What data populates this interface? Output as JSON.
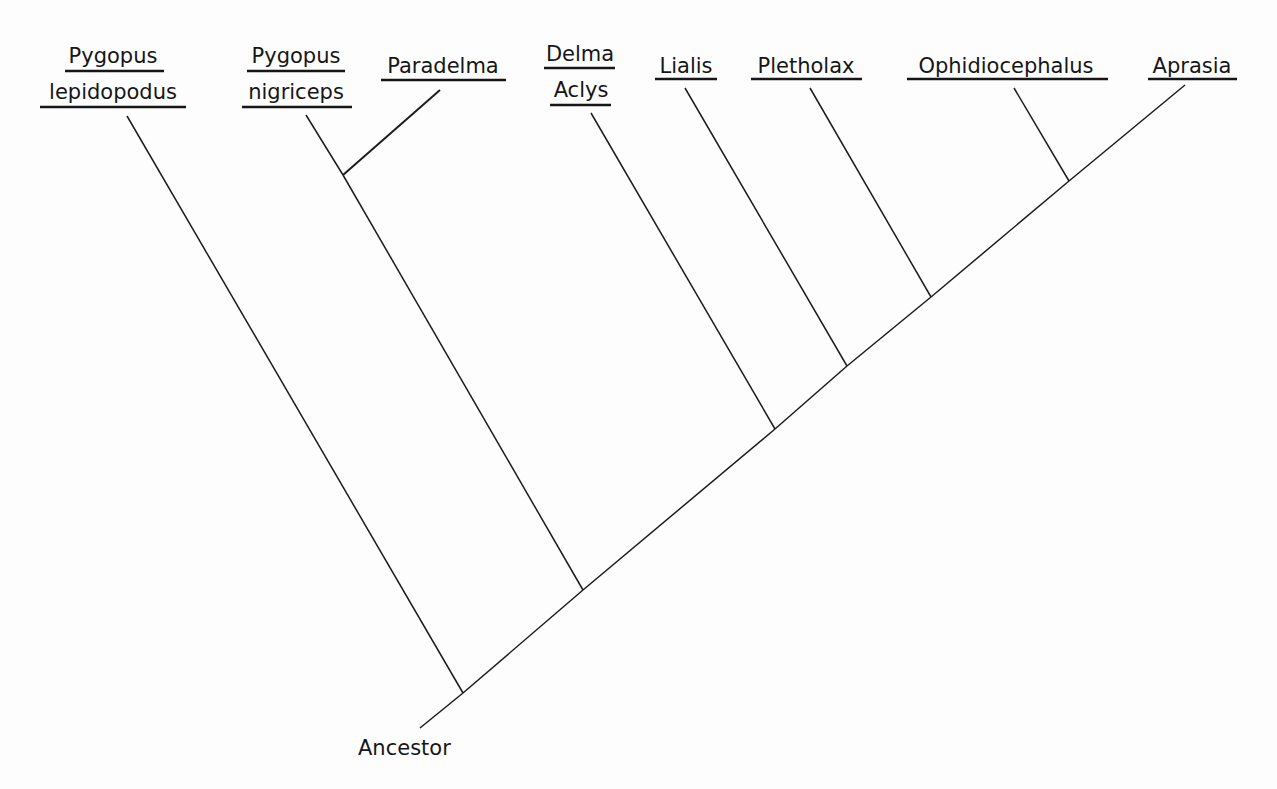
{
  "figure": {
    "type": "cladogram",
    "root_label": "Ancestor",
    "taxa": [
      {
        "id": "pygopus-lepidopodus",
        "lines": [
          "Pygopus",
          "lepidopodus"
        ]
      },
      {
        "id": "pygopus-nigriceps",
        "lines": [
          "Pygopus",
          "nigriceps"
        ]
      },
      {
        "id": "paradelma",
        "lines": [
          "Paradelma"
        ]
      },
      {
        "id": "delma-aclys",
        "lines": [
          "Delma",
          "Aclys"
        ]
      },
      {
        "id": "lialis",
        "lines": [
          "Lialis"
        ]
      },
      {
        "id": "pletholax",
        "lines": [
          "Pletholax"
        ]
      },
      {
        "id": "ophidiocephalus",
        "lines": [
          "Ophidiocephalus"
        ]
      },
      {
        "id": "aprasia",
        "lines": [
          "Aprasia"
        ]
      }
    ],
    "topology": "(Pygopus lepidopodus, ((Pygopus nigriceps, Paradelma), (Delma/Aclys, (Lialis, (Pletholax, (Ophidiocephalus, Aprasia))))))",
    "colors": {
      "ink": "#161616",
      "background": "#fdfdfd"
    }
  }
}
